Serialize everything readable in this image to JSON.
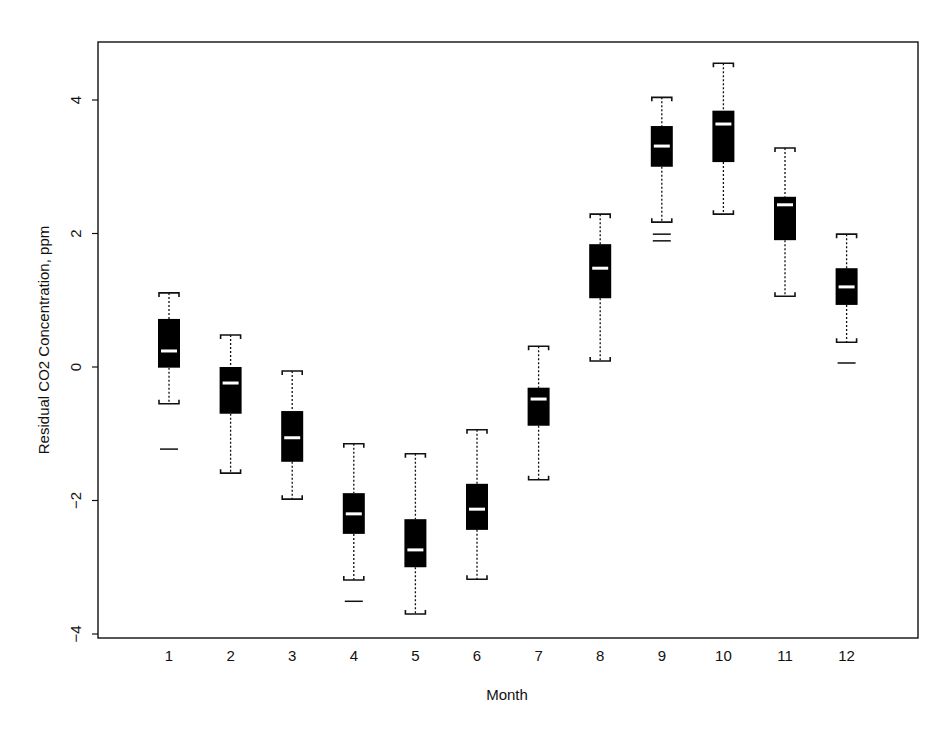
{
  "chart_data": {
    "type": "box",
    "title": "",
    "xlabel": "Month",
    "ylabel": "Residual CO2 Concentration, ppm",
    "categories": [
      "1",
      "2",
      "3",
      "4",
      "5",
      "6",
      "7",
      "8",
      "9",
      "10",
      "11",
      "12"
    ],
    "yticks": [
      4,
      2,
      0,
      -2,
      -4
    ],
    "ylim": [
      -4.05,
      4.85
    ],
    "grid": false,
    "legend": null,
    "boxes": [
      {
        "label": "1",
        "whisker_high": 1.11,
        "q3": 0.72,
        "median": 0.24,
        "q1": -0.01,
        "whisker_low": -0.55,
        "outliers": [
          -1.23
        ]
      },
      {
        "label": "2",
        "whisker_high": 0.48,
        "q3": 0.0,
        "median": -0.24,
        "q1": -0.7,
        "whisker_low": -1.59,
        "outliers": []
      },
      {
        "label": "3",
        "whisker_high": -0.06,
        "q3": -0.66,
        "median": -1.06,
        "q1": -1.42,
        "whisker_low": -1.98,
        "outliers": []
      },
      {
        "label": "4",
        "whisker_high": -1.15,
        "q3": -1.89,
        "median": -2.2,
        "q1": -2.5,
        "whisker_low": -3.19,
        "outliers": [
          -3.51
        ]
      },
      {
        "label": "5",
        "whisker_high": -1.3,
        "q3": -2.28,
        "median": -2.74,
        "q1": -3.0,
        "whisker_low": -3.7,
        "outliers": []
      },
      {
        "label": "6",
        "whisker_high": -0.94,
        "q3": -1.75,
        "median": -2.13,
        "q1": -2.44,
        "whisker_low": -3.18,
        "outliers": []
      },
      {
        "label": "7",
        "whisker_high": 0.31,
        "q3": -0.31,
        "median": -0.48,
        "q1": -0.88,
        "whisker_low": -1.69,
        "outliers": []
      },
      {
        "label": "8",
        "whisker_high": 2.29,
        "q3": 1.84,
        "median": 1.48,
        "q1": 1.03,
        "whisker_low": 0.09,
        "outliers": []
      },
      {
        "label": "9",
        "whisker_high": 4.04,
        "q3": 3.61,
        "median": 3.31,
        "q1": 3.0,
        "whisker_low": 2.17,
        "outliers": [
          1.99,
          1.89
        ]
      },
      {
        "label": "10",
        "whisker_high": 4.55,
        "q3": 3.84,
        "median": 3.64,
        "q1": 3.07,
        "whisker_low": 2.29,
        "outliers": []
      },
      {
        "label": "11",
        "whisker_high": 3.28,
        "q3": 2.55,
        "median": 2.43,
        "q1": 1.9,
        "whisker_low": 1.06,
        "outliers": []
      },
      {
        "label": "12",
        "whisker_high": 1.99,
        "q3": 1.48,
        "median": 1.2,
        "q1": 0.93,
        "whisker_low": 0.37,
        "outliers": [
          0.06
        ]
      }
    ],
    "colors": {
      "box_fill": "#000000",
      "median_line": "#ffffff",
      "whisker": "#111111",
      "frame": "#111111",
      "background": "#ffffff"
    }
  }
}
